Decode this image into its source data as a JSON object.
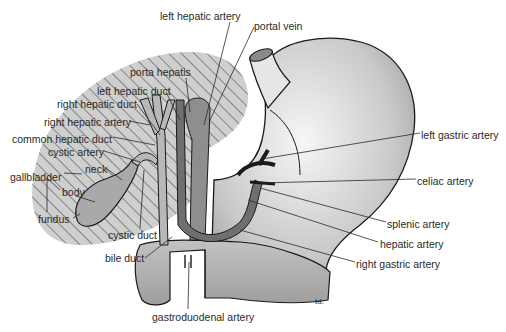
{
  "diagram": {
    "signature": "td.",
    "colors": {
      "outline": "#1a1a1a",
      "liver_fill": "#cfcfcf",
      "hatch": "#2b2b2b",
      "organ_fill_light": "#f2f2f2",
      "organ_fill_dark": "#9a9a9a",
      "duct_fill": "#a8a8a8",
      "vessel_fill": "#7d7d7d",
      "text": "#2a2a2a"
    },
    "labels": [
      {
        "id": "left-hepatic-artery",
        "text": "left hepatic artery",
        "x": 160,
        "y": 10
      },
      {
        "id": "portal-vein",
        "text": "portal vein",
        "x": 254,
        "y": 20
      },
      {
        "id": "porta-hepatis",
        "text": "porta hepatis",
        "x": 130,
        "y": 66
      },
      {
        "id": "left-hepatic-duct",
        "text": "left hepatic duct",
        "x": 97,
        "y": 85
      },
      {
        "id": "right-hepatic-duct",
        "text": "right hepatic duct",
        "x": 57,
        "y": 98
      },
      {
        "id": "right-hepatic-artery",
        "text": "right hepatic artery",
        "x": 44,
        "y": 116
      },
      {
        "id": "common-hepatic-duct",
        "text": "common hepatic duct",
        "x": 12,
        "y": 133
      },
      {
        "id": "cystic-artery",
        "text": "cystic artery",
        "x": 48,
        "y": 146
      },
      {
        "id": "neck",
        "text": "neck",
        "x": 85,
        "y": 163
      },
      {
        "id": "gallbladder",
        "text": "gallbladder",
        "x": 10,
        "y": 171
      },
      {
        "id": "body",
        "text": "body",
        "x": 62,
        "y": 186
      },
      {
        "id": "fundus",
        "text": "fundus",
        "x": 38,
        "y": 213
      },
      {
        "id": "cystic-duct",
        "text": "cystic duct",
        "x": 108,
        "y": 229
      },
      {
        "id": "bile-duct",
        "text": "bile duct",
        "x": 105,
        "y": 252
      },
      {
        "id": "gastroduodenal-artery",
        "text": "gastroduodenal artery",
        "x": 152,
        "y": 311
      },
      {
        "id": "left-gastric-artery",
        "text": "left gastric artery",
        "x": 421,
        "y": 129
      },
      {
        "id": "celiac-artery",
        "text": "celiac artery",
        "x": 417,
        "y": 175
      },
      {
        "id": "splenic-artery",
        "text": "splenic artery",
        "x": 387,
        "y": 218
      },
      {
        "id": "hepatic-artery",
        "text": "hepatic artery",
        "x": 380,
        "y": 238
      },
      {
        "id": "right-gastric-artery",
        "text": "right gastric artery",
        "x": 356,
        "y": 258
      }
    ]
  }
}
